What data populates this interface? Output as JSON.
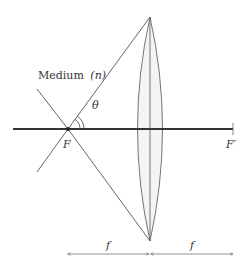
{
  "diagram": {
    "medium_label": "Medium",
    "medium_symbol": "(n)",
    "angle_label": "θ",
    "focal_point_label": "F",
    "focal_point_prime_label": "F′",
    "distance_left_label": "f",
    "distance_right_label": "f",
    "colors": {
      "line": "#555555",
      "axis": "#333333",
      "lens_fill": "#f4f4f4"
    }
  }
}
